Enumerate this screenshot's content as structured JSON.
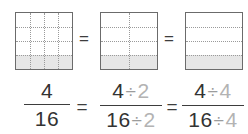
{
  "figure": {
    "background_color": "#ffffff",
    "border_color": "#6b6b6b",
    "grid_line_color": "#9a9a9a",
    "shade_color": "#e6e6e6",
    "text_color": "#333333",
    "dim_text_color": "#b3b3b3"
  },
  "models": [
    {
      "name": "sixteenths-model",
      "columns": 4,
      "rows": 4,
      "total_parts": 16,
      "shaded_parts": 4,
      "shaded_fraction": "4/16",
      "shaded_rows_from_bottom": 1
    },
    {
      "name": "eighths-model",
      "columns": 2,
      "rows": 4,
      "total_parts": 8,
      "shaded_parts": 2,
      "shaded_fraction": "2/8",
      "shaded_rows_from_bottom": 1
    },
    {
      "name": "fourths-model",
      "columns": 1,
      "rows": 4,
      "total_parts": 4,
      "shaded_parts": 1,
      "shaded_fraction": "1/4",
      "shaded_rows_from_bottom": 1
    }
  ],
  "equals_top": {
    "first": "=",
    "second": "="
  },
  "equals_bottom": {
    "first": "=",
    "second": "="
  },
  "fractions": [
    {
      "name": "fraction-four-sixteenths",
      "numerator": "4",
      "denominator": "16",
      "numerator_divisor": "",
      "denominator_divisor": "",
      "division_symbol": ""
    },
    {
      "name": "fraction-divide-by-two",
      "numerator": "4",
      "denominator": "16",
      "numerator_divisor": "2",
      "denominator_divisor": "2",
      "division_symbol": "÷"
    },
    {
      "name": "fraction-divide-by-four",
      "numerator": "4",
      "denominator": "16",
      "numerator_divisor": "4",
      "denominator_divisor": "4",
      "division_symbol": "÷"
    }
  ]
}
